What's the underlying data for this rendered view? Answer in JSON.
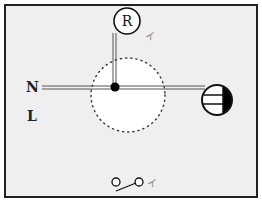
{
  "diagram": {
    "labels": {
      "neutral": "N",
      "live": "L",
      "receptacle": "R",
      "mark_receptacle": "イ",
      "mark_switch": "イ"
    },
    "colors": {
      "background": "#efefef",
      "frame": "#222222",
      "wire": "#555555",
      "dots": "#333333",
      "fill_black": "#000000",
      "fill_white": "#ffffff"
    },
    "components": [
      {
        "name": "receptacle",
        "label": "R"
      },
      {
        "name": "junction-box",
        "style": "dotted-circle"
      },
      {
        "name": "lamp",
        "style": "half-filled-circle-with-stripes"
      },
      {
        "name": "switch",
        "style": "single-pole"
      }
    ]
  }
}
